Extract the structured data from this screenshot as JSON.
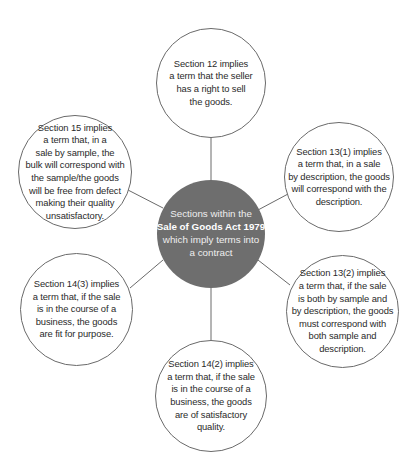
{
  "diagram": {
    "center": {
      "lines": [
        "Sections within the",
        "Sale of Goods Act 1979",
        "which imply terms into",
        "a contract"
      ],
      "bold_line_index": 1,
      "fill_color": "#6e6e6e",
      "text_color": "#eeeeee"
    },
    "nodes": [
      {
        "id": "section-12",
        "position": "top",
        "lines": [
          "Section 12 implies",
          "a term that the seller",
          "has a right to sell",
          "the goods."
        ]
      },
      {
        "id": "section-13-1",
        "position": "upper-right",
        "lines": [
          "Section 13(1) implies",
          "a term that, in a sale",
          "by description, the goods",
          "will correspond with the",
          "description."
        ]
      },
      {
        "id": "section-13-2",
        "position": "lower-right",
        "lines": [
          "Section 13(2) implies",
          "a term that, if the sale",
          "is both by sample and",
          "by description, the goods",
          "must correspond with",
          "both sample and",
          "description."
        ]
      },
      {
        "id": "section-14-2",
        "position": "bottom",
        "lines": [
          "Section 14(2) implies",
          "a term that, if the sale",
          "is in the course of a",
          "business, the goods",
          "are of satisfactory",
          "quality."
        ]
      },
      {
        "id": "section-14-3",
        "position": "lower-left",
        "lines": [
          "Section 14(3) implies",
          "a term that, if the sale",
          "is in the course of a",
          "business, the goods",
          "are fit for purpose."
        ]
      },
      {
        "id": "section-15",
        "position": "upper-left",
        "lines": [
          "Section 15 implies",
          "a term that, in a",
          "sale by sample, the",
          "bulk will correspond with",
          "the sample/the goods",
          "will be free from defect",
          "making their quality",
          "unsatisfactory."
        ]
      }
    ],
    "colors": {
      "connector": "#6a6a6a",
      "outer_border": "#6a6a6a",
      "outer_fill": "#ffffff",
      "outer_text": "#2a2a2a"
    }
  }
}
